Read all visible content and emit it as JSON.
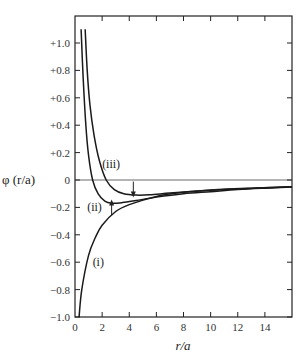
{
  "chart_data": {
    "type": "line",
    "title": "",
    "xlabel": "r/a",
    "ylabel": "φ (r/a)",
    "xlim": [
      0,
      16
    ],
    "ylim": [
      -1.0,
      1.15
    ],
    "xticks": [
      0,
      2,
      4,
      6,
      8,
      10,
      12,
      14
    ],
    "xtick_labels": [
      "0",
      "2",
      "4",
      "6",
      "8",
      "10",
      "12",
      "14"
    ],
    "yticks": [
      1.0,
      0.8,
      0.6,
      0.4,
      0.2,
      0,
      -0.2,
      -0.4,
      -0.6,
      -0.8,
      -1.0
    ],
    "ytick_labels": [
      "+1.0",
      "+0.8",
      "+0.6",
      "+0.4",
      "+0.2",
      "0",
      "−0.2",
      "−0.4",
      "−0.6",
      "−0.8",
      "−1.0"
    ],
    "grid": false,
    "zero_line": true,
    "series": [
      {
        "name": "(i)",
        "x": [
          0.3,
          0.5,
          1,
          1.5,
          2,
          3,
          4,
          6,
          8,
          10,
          12,
          14,
          16
        ],
        "y": [
          -1.0,
          -0.8,
          -0.55,
          -0.42,
          -0.33,
          -0.23,
          -0.18,
          -0.12,
          -0.09,
          -0.075,
          -0.065,
          -0.057,
          -0.05
        ]
      },
      {
        "name": "(ii)",
        "x": [
          0.45,
          0.6,
          0.8,
          1.0,
          1.3,
          1.7,
          2.2,
          2.7,
          3.5,
          4.5,
          6,
          8,
          10,
          12,
          14,
          16
        ],
        "y": [
          1.1,
          0.75,
          0.4,
          0.18,
          0.0,
          -0.1,
          -0.155,
          -0.17,
          -0.165,
          -0.15,
          -0.125,
          -0.1,
          -0.085,
          -0.07,
          -0.06,
          -0.052
        ]
      },
      {
        "name": "(iii)",
        "x": [
          0.75,
          0.9,
          1.1,
          1.4,
          1.8,
          2.3,
          2.9,
          3.6,
          4.5,
          5.5,
          7,
          9,
          11,
          13,
          16
        ],
        "y": [
          1.1,
          0.8,
          0.55,
          0.33,
          0.14,
          0.0,
          -0.07,
          -0.1,
          -0.11,
          -0.108,
          -0.095,
          -0.08,
          -0.068,
          -0.06,
          -0.05
        ]
      }
    ],
    "annotations": [
      {
        "text": "(i)",
        "x": 1.3,
        "y": -0.6
      },
      {
        "text": "(ii)",
        "x": 0.9,
        "y": -0.2
      },
      {
        "text": "(iii)",
        "x": 2.0,
        "y": 0.12
      },
      {
        "type": "arrow",
        "direction": "up",
        "x": 2.7,
        "y": -0.2
      },
      {
        "type": "arrow",
        "direction": "down",
        "x": 4.3,
        "y": -0.07
      }
    ]
  }
}
